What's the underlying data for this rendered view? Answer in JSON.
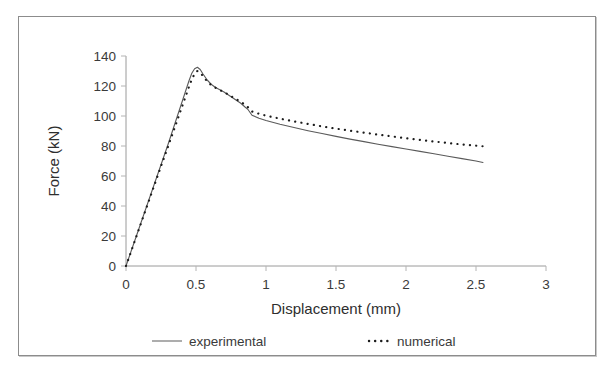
{
  "figure": {
    "background_color": "#ffffff",
    "frame_color": "#8c8c8c"
  },
  "chart_data": {
    "type": "line",
    "title": "",
    "xlabel": "Displacement (mm)",
    "ylabel": "Force (kN)",
    "xlim": [
      0,
      3
    ],
    "ylim": [
      0,
      140
    ],
    "xticks": [
      "0",
      "0.5",
      "1",
      "1.5",
      "2",
      "2.5",
      "3"
    ],
    "xtick_values": [
      0,
      0.5,
      1,
      1.5,
      2,
      2.5,
      3
    ],
    "yticks": [
      "0",
      "20",
      "40",
      "60",
      "80",
      "100",
      "120",
      "140"
    ],
    "ytick_values": [
      0,
      20,
      40,
      60,
      80,
      100,
      120,
      140
    ],
    "grid": false,
    "legend_position": "bottom",
    "colors": {
      "experimental": "#5a5a5a",
      "numerical": "#1c1c1c"
    },
    "series": [
      {
        "name": "experimental",
        "style": "solid",
        "x": [
          0.0,
          0.05,
          0.1,
          0.15,
          0.2,
          0.25,
          0.3,
          0.33,
          0.36,
          0.39,
          0.42,
          0.45,
          0.47,
          0.49,
          0.51,
          0.53,
          0.55,
          0.58,
          0.61,
          0.64,
          0.67,
          0.7,
          0.74,
          0.78,
          0.82,
          0.85,
          0.87,
          0.9,
          0.95,
          1.0,
          1.1,
          1.2,
          1.3,
          1.4,
          1.5,
          1.6,
          1.7,
          1.8,
          1.9,
          2.0,
          2.1,
          2.2,
          2.3,
          2.4,
          2.5,
          2.55
        ],
        "y": [
          0.0,
          13.5,
          27.0,
          40.5,
          54.0,
          67.5,
          81.0,
          89.5,
          98.0,
          106.5,
          115.0,
          123.5,
          128.5,
          131.5,
          132.5,
          131.0,
          128.0,
          124.0,
          121.0,
          119.0,
          117.5,
          116.0,
          113.5,
          111.0,
          108.5,
          106.0,
          104.5,
          100.5,
          98.5,
          97.0,
          94.5,
          92.3,
          90.2,
          88.3,
          86.4,
          84.6,
          82.9,
          81.2,
          79.6,
          78.0,
          76.4,
          74.8,
          73.2,
          71.6,
          70.0,
          69.0
        ]
      },
      {
        "name": "numerical",
        "style": "dotted",
        "x": [
          0.0,
          0.05,
          0.1,
          0.15,
          0.2,
          0.25,
          0.3,
          0.33,
          0.36,
          0.39,
          0.42,
          0.45,
          0.47,
          0.49,
          0.51,
          0.53,
          0.55,
          0.58,
          0.61,
          0.64,
          0.67,
          0.7,
          0.74,
          0.78,
          0.82,
          0.86,
          0.9,
          0.95,
          1.0,
          1.1,
          1.2,
          1.3,
          1.4,
          1.5,
          1.6,
          1.7,
          1.8,
          1.9,
          2.0,
          2.1,
          2.2,
          2.3,
          2.4,
          2.5,
          2.55
        ],
        "y": [
          0.0,
          13.3,
          26.6,
          39.9,
          53.2,
          66.5,
          79.5,
          87.5,
          95.5,
          103.5,
          111.5,
          119.5,
          124.5,
          128.0,
          130.0,
          129.0,
          126.5,
          123.0,
          120.5,
          118.8,
          117.3,
          116.0,
          113.8,
          111.6,
          109.4,
          107.0,
          103.0,
          101.5,
          100.2,
          98.2,
          96.4,
          94.7,
          93.1,
          91.6,
          90.2,
          88.9,
          87.6,
          86.4,
          85.2,
          84.1,
          83.0,
          82.0,
          81.0,
          80.2,
          79.8
        ]
      }
    ],
    "annotations": {
      "peak_force": 132.5,
      "peak_displacement": 0.5
    }
  },
  "legend": {
    "items": [
      {
        "label": "experimental",
        "style": "solid"
      },
      {
        "label": "numerical",
        "style": "dotted"
      }
    ]
  }
}
